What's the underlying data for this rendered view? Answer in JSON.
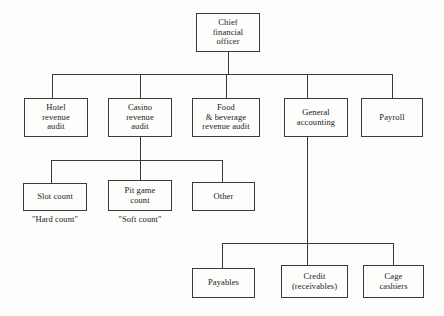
{
  "diagram": {
    "colors": {
      "background": "#fdfdfb",
      "line": "#3a3a3a",
      "text": "#1a1a1a",
      "box_fill": "#fdfdfb"
    },
    "nodes": {
      "cfo": {
        "label": "Chief\nfinancial\nofficer",
        "lines": [
          "Chief",
          "financial",
          "officer"
        ]
      },
      "hotel_revenue_audit": {
        "label": "Hotel\nrevenue\naudit",
        "lines": [
          "Hotel",
          "revenue",
          "audit"
        ]
      },
      "casino_revenue_audit": {
        "label": "Casino\nrevenue\naudit",
        "lines": [
          "Casino",
          "revenue",
          "audit"
        ]
      },
      "food_beverage_revenue_audit": {
        "label": "Food\n& beverage\nrevenue audit",
        "lines": [
          "Food",
          "& beverage",
          "revenue audit"
        ]
      },
      "general_accounting": {
        "label": "General\naccounting",
        "lines": [
          "General",
          "accounting"
        ]
      },
      "payroll": {
        "label": "Payroll",
        "lines": [
          "Payroll"
        ]
      },
      "slot_count": {
        "label": "Slot count",
        "lines": [
          "Slot count"
        ]
      },
      "pit_game_count": {
        "label": "Pit game\ncount",
        "lines": [
          "Pit game",
          "count"
        ]
      },
      "other": {
        "label": "Other",
        "lines": [
          "Other"
        ]
      },
      "payables": {
        "label": "Payables",
        "lines": [
          "Payables"
        ]
      },
      "credit_receivables": {
        "label": "Credit\n(receivables)",
        "lines": [
          "Credit",
          "(receivables)"
        ]
      },
      "cage_cashiers": {
        "label": "Cage\ncashiers",
        "lines": [
          "Cage",
          "cashiers"
        ]
      }
    },
    "captions": {
      "hard_count": "\"Hard count\"",
      "soft_count": "\"Soft count\""
    },
    "hierarchy": {
      "root": "cfo",
      "level_2": [
        "hotel_revenue_audit",
        "casino_revenue_audit",
        "food_beverage_revenue_audit",
        "general_accounting",
        "payroll"
      ],
      "casino_children": [
        "slot_count",
        "pit_game_count",
        "other"
      ],
      "general_accounting_children": [
        "payables",
        "credit_receivables",
        "cage_cashiers"
      ]
    }
  }
}
